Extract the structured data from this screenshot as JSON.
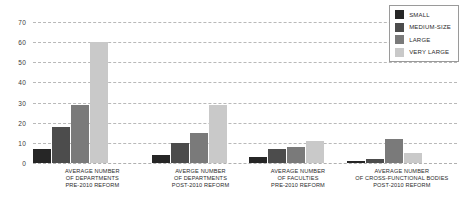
{
  "chart_data": {
    "type": "bar",
    "title": "",
    "xlabel": "",
    "ylabel": "",
    "ylim": [
      0,
      70
    ],
    "yticks": [
      0,
      10,
      20,
      30,
      40,
      50,
      60,
      70
    ],
    "grid": true,
    "legend_position": "top-right",
    "categories": [
      "AVERAGE NUMBER OF DEPARTMENTS PRE-2010 REFORM",
      "AVERGE NUMBER OF DEPARTMENTS POST-2010 REFORM",
      "AVERAGE NUMBER OF FACULTIES PRE-2010 REFORM",
      "AVERAGE NUMBER OF CROSS-FUNCTIONAL BODIES POST-2010 REFORM"
    ],
    "category_lines": [
      [
        "AVERAGE NUMBER",
        "OF DEPARTMENTS",
        "PRE-2010  REFORM"
      ],
      [
        "AVERGE NUMBER",
        "OF DEPARTMENTS",
        "POST-2010 REFORM"
      ],
      [
        "AVERAGE NUMBER",
        "OF FACULTIES",
        "PRE-2010 REFORM"
      ],
      [
        "AVERAGE NUMBER",
        "OF CROSS-FUNCTIONAL BODIES",
        "POST-2010 REFORM"
      ]
    ],
    "series": [
      {
        "name": "SMALL",
        "color": "#262626",
        "values": [
          7,
          4,
          3,
          1
        ]
      },
      {
        "name": "MEDIUM-SIZE",
        "color": "#4c4c4c",
        "values": [
          18,
          10,
          7,
          2
        ]
      },
      {
        "name": "LARGE",
        "color": "#7a7a7a",
        "values": [
          29,
          15,
          8,
          12
        ]
      },
      {
        "name": "VERY LARGE",
        "color": "#c9c9c9",
        "values": [
          60,
          29,
          11,
          5
        ]
      }
    ]
  },
  "legend": {
    "items": [
      {
        "label": "SMALL",
        "color": "#262626"
      },
      {
        "label": "MEDIUM-SIZE",
        "color": "#4c4c4c"
      },
      {
        "label": "LARGE",
        "color": "#7a7a7a"
      },
      {
        "label": "VERY LARGE",
        "color": "#c9c9c9"
      }
    ]
  },
  "axis": {
    "y_tick_labels": [
      "0",
      "10",
      "20",
      "30",
      "40",
      "50",
      "60",
      "70"
    ]
  }
}
